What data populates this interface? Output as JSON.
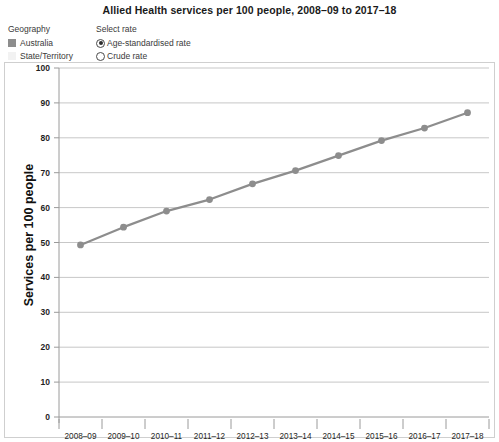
{
  "header": {
    "title": "Allied Health services per 100 people, 2008–09 to 2017–18"
  },
  "controls": {
    "geography": {
      "label": "Geography",
      "items": [
        {
          "label": "Australia",
          "swatch": "filled",
          "color": "#8d8d8d"
        },
        {
          "label": "State/Territory",
          "swatch": "empty",
          "color": "#f2f2f2"
        }
      ]
    },
    "rate": {
      "label": "Select rate",
      "options": [
        {
          "label": "Age-standardised rate",
          "selected": true
        },
        {
          "label": "Crude rate",
          "selected": false
        }
      ]
    }
  },
  "chart_data": {
    "type": "line",
    "title": "Allied Health services per 100 people, 2008–09 to 2017–18",
    "xlabel": "",
    "ylabel": "Services per 100 people",
    "ylim": [
      0,
      100
    ],
    "ytick_step": 10,
    "yticks": [
      0,
      10,
      20,
      30,
      40,
      50,
      60,
      70,
      80,
      90,
      100
    ],
    "grid": true,
    "legend_position": "top-left",
    "series_color": "#8d8d8d",
    "categories": [
      "2008–09",
      "2009–10",
      "2010–11",
      "2011–12",
      "2012–13",
      "2013–14",
      "2014–15",
      "2015–16",
      "2016–17",
      "2017–18"
    ],
    "series": [
      {
        "name": "Australia",
        "values": [
          49.3,
          54.4,
          59.0,
          62.3,
          66.8,
          70.6,
          74.9,
          79.2,
          82.8,
          87.2
        ]
      }
    ]
  }
}
